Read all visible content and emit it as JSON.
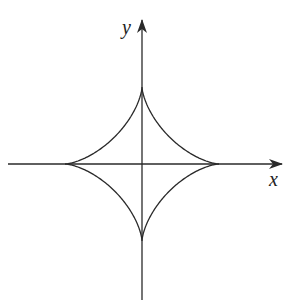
{
  "diagram": {
    "type": "astroid",
    "axes": {
      "x_label": "x",
      "y_label": "y"
    },
    "geometry": {
      "origin": [
        142,
        164
      ],
      "radius": 77,
      "x_axis": {
        "from": 8,
        "to": 282,
        "y": 164
      },
      "y_axis": {
        "from": 300,
        "to": 20,
        "x": 142
      }
    },
    "colors": {
      "stroke": "#2a2a2a",
      "background": "#ffffff"
    }
  }
}
